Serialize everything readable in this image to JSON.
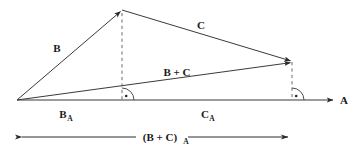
{
  "figure": {
    "background_color": "#ffffff",
    "line_color": "#3a3a3a",
    "dashed_color": "#6b6b6b",
    "text_color": "#1a1a1a",
    "width": 361,
    "height": 156
  },
  "labels": {
    "axis_a": "A",
    "vector_b": "B",
    "vector_c": "C",
    "vector_b_plus_c_main": "B + C",
    "projection_b_base": "B",
    "projection_b_sub": "A",
    "projection_c_base": "C",
    "projection_c_sub": "A",
    "dimension_base": "(B + C)",
    "dimension_sub": "A"
  },
  "geometry": {
    "origin": {
      "x": 17,
      "y": 100
    },
    "apex": {
      "x": 122,
      "y": 10
    },
    "right_vertex": {
      "x": 292,
      "y": 62
    },
    "axis_end": {
      "x": 337,
      "y": 100
    },
    "foot_b": {
      "x": 122,
      "y": 100
    },
    "foot_c": {
      "x": 292,
      "y": 100
    },
    "dimension_y": 137
  }
}
